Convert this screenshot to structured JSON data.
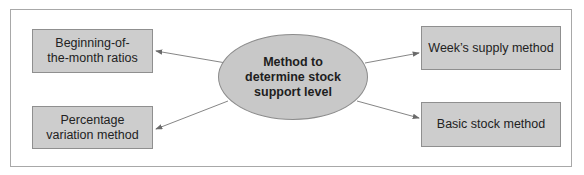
{
  "diagram": {
    "center": {
      "label": "Method to determine stock support level"
    },
    "nodes": [
      {
        "id": "beginning-of-month",
        "label": "Beginning-of-the-month ratios",
        "position": "top-left"
      },
      {
        "id": "percentage-variation",
        "label": "Percentage variation method",
        "position": "bottom-left"
      },
      {
        "id": "weeks-supply",
        "label": "Week’s supply method",
        "position": "top-right"
      },
      {
        "id": "basic-stock",
        "label": "Basic stock method",
        "position": "bottom-right"
      }
    ],
    "colors": {
      "box_fill": "#cdcdcd",
      "ellipse_fill": "#c8c8c8",
      "border": "#8f8f8f",
      "arrow": "#6a6a6a"
    }
  }
}
